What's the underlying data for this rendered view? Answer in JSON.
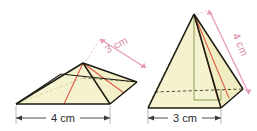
{
  "diagram": {
    "background_color": "#ffffff",
    "figures": [
      {
        "id": "left-pyramid",
        "name": "flat-square-pyramid",
        "shape": "square-based pyramid (low viewing angle)",
        "base_label": "4 cm",
        "base_label_name": "base-length-label-left",
        "slant_label": "3 cm",
        "slant_label_name": "slant-height-label-left",
        "slant_label_rotation_deg": -27
      },
      {
        "id": "right-pyramid",
        "name": "tall-square-pyramid",
        "shape": "square-based pyramid (upright viewing angle)",
        "base_label": "3 cm",
        "base_label_name": "base-length-label-right",
        "slant_label": "4 cm",
        "slant_label_name": "slant-edge-label-right",
        "slant_label_rotation_deg": 66
      }
    ],
    "colors": {
      "face_fill": "#f5f2d0",
      "face_fill_light": "#faf8e4",
      "edge_stroke": "#1c1c12",
      "hidden_edge_stroke": "#7a7a4a",
      "red_line": "#e05a4a",
      "green_line": "#8a9a5a",
      "pink_arrow": "#e79ab8",
      "label_text": "#2b2b2b",
      "slant_text": "#d98aa8"
    }
  }
}
